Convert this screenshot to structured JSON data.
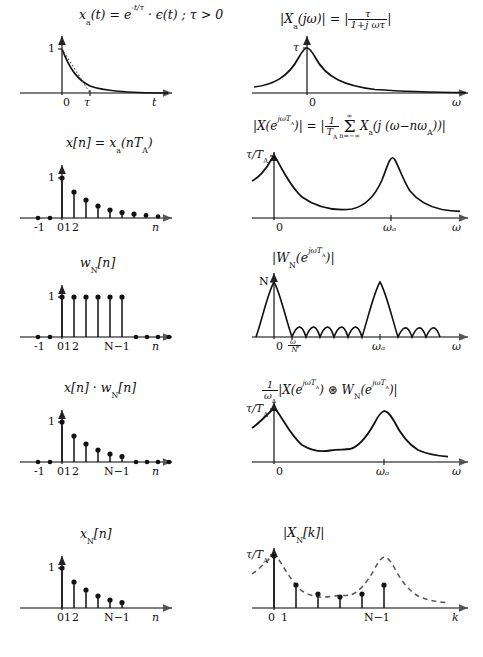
{
  "figure": {
    "rows": 5,
    "columns": 2,
    "ink_color": "#111111",
    "axis_color": "#555555",
    "dashed_envelope_color": "#555555"
  },
  "row1": {
    "left": {
      "equation_parts": {
        "lhs": "x",
        "lhs_sub": "a",
        "lhs_arg": "(t) = e",
        "exp": "-t/τ",
        "rhs": " · ϵ(t)  ;   τ > 0"
      },
      "equation_plain": "x_a(t) = e^{-t/τ} · ϵ(t) ; τ > 0",
      "y_tick": "1",
      "x_ticks": [
        "0",
        "τ"
      ],
      "x_axis_label": "t",
      "curve": "decaying exponential with dotted tangent at t=0 hitting zero at τ"
    },
    "right": {
      "equation_plain": "|X_a(jω)| = |τ/(1+jωτ)|",
      "lhs": "|X",
      "lhs_sub": "a",
      "lhs_rest": "(jω)| = |",
      "frac_num": "τ",
      "frac_den": "1+j ωτ",
      "tail": "|",
      "y_tick": "τ",
      "x_ticks": [
        "0"
      ],
      "x_axis_label": "ω",
      "curve": "Lorentzian magnitude peak at ω=0"
    }
  },
  "row2": {
    "left": {
      "equation_plain": "x[n] = x_a(nT_A)",
      "lhs": "x[n] = x",
      "lhs_sub": "a",
      "lhs_rest": "(nT",
      "lhs_sub2": "A",
      "lhs_tail": ")",
      "y_tick": "1",
      "x_ticks": [
        "-1",
        "0",
        "1",
        "2"
      ],
      "x_axis_label": "n",
      "stem_values": [
        0,
        0,
        1,
        0.66,
        0.44,
        0.3,
        0.2,
        0.14,
        0.1,
        0.07,
        0.05,
        0.035,
        0.025,
        0.02,
        0.015
      ],
      "stem_start_index": -2
    },
    "right": {
      "equation_plain": "|X(e^{jωT_A})| = |1/T_A Σ_{n=-∞}^{∞} X_a(j(ω-nω_A))|",
      "part1": "|X(e",
      "part1_sup": "jωT",
      "part1_sup_sub": "A",
      "part2": ")| = |",
      "frac_num": "1",
      "frac_den": "T",
      "frac_den_sub": "A",
      "sum_top": "∞",
      "sum_sign": "Σ",
      "sum_bot": "n=−∞",
      "part3": "X",
      "part3_sub": "a",
      "part4": "(j (ω−nω",
      "part4_sub": "A",
      "part5": "))|",
      "y_tick_num": "τ",
      "y_tick_den": "T",
      "y_tick_den_sub": "A",
      "x_ticks": [
        "0",
        "ωₐ"
      ],
      "x_axis_label": "ω",
      "curve": "periodic repetition of Lorentzian peaks at 0 and ω_A"
    }
  },
  "row3": {
    "left": {
      "equation_plain": "w_N[n]",
      "lhs": "w",
      "lhs_sub": "N",
      "lhs_rest": "[n]",
      "y_tick": "1",
      "x_ticks": [
        "-1",
        "0",
        "1",
        "2",
        "N−1"
      ],
      "x_axis_label": "n",
      "window_length_N": 6,
      "stem_values": [
        0,
        0,
        1,
        1,
        1,
        1,
        1,
        1,
        0,
        0,
        0,
        0,
        0,
        0,
        0
      ],
      "stem_start_index": -2
    },
    "right": {
      "equation_plain": "|W_N(e^{jωT_A})|",
      "part1": "|W",
      "part1_sub": "N",
      "part2": "(e",
      "part2_sup": "jωT",
      "part2_sup_sub": "A",
      "part3": ")|",
      "y_tick": "N",
      "x_ticks": [
        "0",
        "ωₐ/N",
        "ωₐ"
      ],
      "x_tick_frac_num": "ω",
      "x_tick_frac_num_sub": "A",
      "x_tick_frac_den": "N",
      "x_axis_label": "ω",
      "curve": "Dirichlet kernel, main lobes at 0 and ω_A, 5 sidelobes between"
    }
  },
  "row4": {
    "left": {
      "equation_plain": "x[n] · w_N[n]",
      "part1": "x[n] · w",
      "part1_sub": "N",
      "part2": "[n]",
      "y_tick": "1",
      "x_ticks": [
        "-1",
        "0",
        "1",
        "2",
        "N−1"
      ],
      "x_axis_label": "n",
      "stem_values": [
        0,
        0,
        1,
        0.66,
        0.44,
        0.3,
        0.2,
        0.14,
        0,
        0,
        0,
        0,
        0,
        0,
        0
      ],
      "stem_start_index": -2
    },
    "right": {
      "equation_plain": "(1/ω_A)|X(e^{jωT_A}) ⊛ W_N(e^{jωT_A})|",
      "frac_num": "1",
      "frac_den": "ω",
      "frac_den_sub": "A",
      "part1": "|X(e",
      "part1_sup": "jωT",
      "part1_sup_sub": "A",
      "part2": ") ⊛ W",
      "part2_sub": "N",
      "part3": "(e",
      "part3_sup": "jωT",
      "part3_sup_sub": "A",
      "part4": ")|",
      "y_tick_num": "τ",
      "y_tick_den": "T",
      "y_tick_den_sub": "A",
      "x_ticks": [
        "0",
        "ωₐ"
      ],
      "x_axis_label": "ω",
      "curve": "smeared periodic peaks (convolution result)"
    }
  },
  "row5": {
    "left": {
      "equation_plain": "x_N[n]",
      "lhs": "x",
      "lhs_sub": "N",
      "lhs_rest": "[n]",
      "y_tick": "1",
      "x_ticks": [
        "0",
        "1",
        "2",
        "N−1"
      ],
      "x_axis_label": "n",
      "stem_values": [
        1,
        0.66,
        0.44,
        0.3,
        0.2,
        0.14
      ],
      "stem_start_index": 0
    },
    "right": {
      "equation_plain": "|X_N[k]|",
      "part1": "|X",
      "part1_sub": "N",
      "part2": "[k]|",
      "y_tick_num": "τ",
      "y_tick_den": "T",
      "y_tick_den_sub": "A",
      "x_ticks": [
        "0",
        "1",
        "N−1"
      ],
      "x_axis_label": "k",
      "sample_values": [
        1.0,
        0.52,
        0.31,
        0.24,
        0.31,
        0.52
      ],
      "envelope": "dashed continuous convolution spectrum"
    }
  }
}
